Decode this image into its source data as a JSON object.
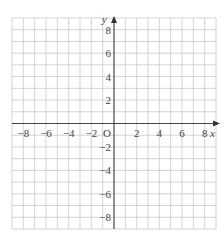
{
  "diagram": {
    "type": "coordinate-grid",
    "x_axis": {
      "label": "x",
      "min": -9,
      "max": 9,
      "tick_labels": [
        "−8",
        "−6",
        "−4",
        "−2",
        "2",
        "4",
        "6",
        "8"
      ],
      "tick_values": [
        -8,
        -6,
        -4,
        -2,
        2,
        4,
        6,
        8
      ]
    },
    "y_axis": {
      "label": "y",
      "min": -9,
      "max": 9,
      "tick_labels": [
        "8",
        "6",
        "4",
        "2",
        "−2",
        "−4",
        "−6",
        "−8"
      ],
      "tick_values": [
        8,
        6,
        4,
        2,
        -2,
        -4,
        -6,
        -8
      ]
    },
    "origin_label": "O",
    "grid_step": 1,
    "colors": {
      "grid": "#c8c8c8",
      "axis": "#444444",
      "text": "#444444"
    }
  }
}
